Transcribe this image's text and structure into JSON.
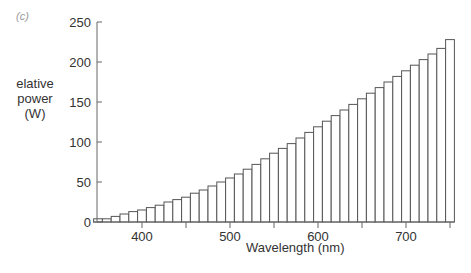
{
  "panel_label": "(c)",
  "chart_data": {
    "type": "bar",
    "title": "",
    "xlabel": "Wavelength (nm)",
    "ylabel": "elative power (W)",
    "ylabel_lines": [
      "elative",
      "power",
      "(W)"
    ],
    "x": [
      350,
      360,
      370,
      380,
      390,
      400,
      410,
      420,
      430,
      440,
      450,
      460,
      470,
      480,
      490,
      500,
      510,
      520,
      530,
      540,
      550,
      560,
      570,
      580,
      590,
      600,
      610,
      620,
      630,
      640,
      650,
      660,
      670,
      680,
      690,
      700,
      710,
      720,
      730,
      740,
      750
    ],
    "values": [
      4,
      4,
      7,
      10,
      13,
      15,
      18,
      21,
      25,
      28,
      31,
      36,
      40,
      45,
      50,
      55,
      60,
      66,
      72,
      79,
      86,
      92,
      98,
      105,
      112,
      119,
      126,
      133,
      140,
      147,
      154,
      161,
      168,
      175,
      182,
      189,
      196,
      203,
      210,
      217,
      228
    ],
    "xlim": [
      345,
      755
    ],
    "ylim": [
      0,
      250
    ],
    "xticks": [
      400,
      500,
      600,
      700
    ],
    "xticks_minor": [
      450,
      550,
      650,
      750
    ],
    "yticks": [
      0,
      50,
      100,
      150,
      200,
      250
    ],
    "grid": false,
    "legend": null,
    "bar_fill": "#ffffff",
    "bar_edge": "#555555"
  }
}
